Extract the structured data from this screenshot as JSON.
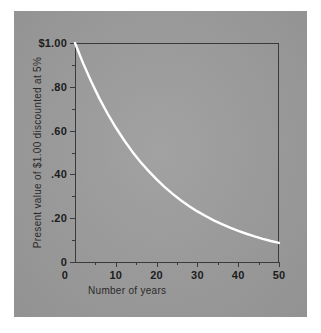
{
  "figure": {
    "panel_color": "#9d9d9d",
    "background_color": "#ffffff",
    "curve_color": "#ffffff",
    "axis_color": "#3a3a3a",
    "text_color": "#1c1c1c"
  },
  "chart_data": {
    "type": "line",
    "title": "",
    "xlabel": "Number of years",
    "ylabel": "Present value of $1.00 discounted at 5%",
    "xlim": [
      0,
      50
    ],
    "ylim": [
      0,
      1.0
    ],
    "grid": false,
    "legend": null,
    "x_ticks": [
      0,
      10,
      20,
      30,
      40,
      50
    ],
    "x_tick_labels": [
      "0",
      "10",
      "20",
      "30",
      "40",
      "50"
    ],
    "x_minor_ticks": [
      5,
      15,
      25,
      35,
      45
    ],
    "y_ticks": [
      0,
      0.2,
      0.4,
      0.6,
      0.8,
      1.0
    ],
    "y_tick_labels": [
      "0",
      ".20",
      ".40",
      ".60",
      ".80",
      "$1.00"
    ],
    "y_minor_ticks": [
      0.1,
      0.3,
      0.5,
      0.7,
      0.9
    ],
    "series": [
      {
        "name": "Present value of $1.00 discounted at 5%",
        "color": "#ffffff",
        "x": [
          0,
          2,
          4,
          6,
          8,
          10,
          12,
          14,
          16,
          18,
          20,
          22,
          24,
          26,
          28,
          30,
          32,
          34,
          36,
          38,
          40,
          42,
          44,
          46,
          48,
          50
        ],
        "values": [
          1.0,
          0.907,
          0.823,
          0.746,
          0.677,
          0.614,
          0.557,
          0.505,
          0.458,
          0.416,
          0.377,
          0.342,
          0.31,
          0.281,
          0.255,
          0.231,
          0.21,
          0.19,
          0.173,
          0.157,
          0.142,
          0.129,
          0.117,
          0.106,
          0.096,
          0.087
        ]
      }
    ]
  }
}
